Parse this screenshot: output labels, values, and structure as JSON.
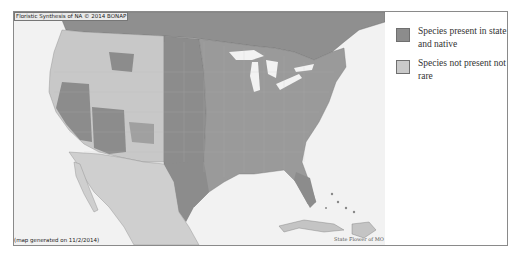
{
  "map": {
    "title_caption": "Floristic Synthesis of NA © 2014 BONAP",
    "generated_caption": "(map generated on 11/2/2014)",
    "flower_caption": "State Flower of MO",
    "colors": {
      "ocean": "#f2f2f2",
      "present_native": "#8c8c8c",
      "not_present": "#c8c8c8",
      "canada": "#8f8f8f",
      "mexico": "#cfcfcf",
      "lakes": "#f2f2f2"
    }
  },
  "legend": {
    "items": [
      {
        "label": "Species present in state and native",
        "color": "#8c8c8c"
      },
      {
        "label": "Species not present not rare",
        "color": "#c9c9c9"
      }
    ]
  }
}
